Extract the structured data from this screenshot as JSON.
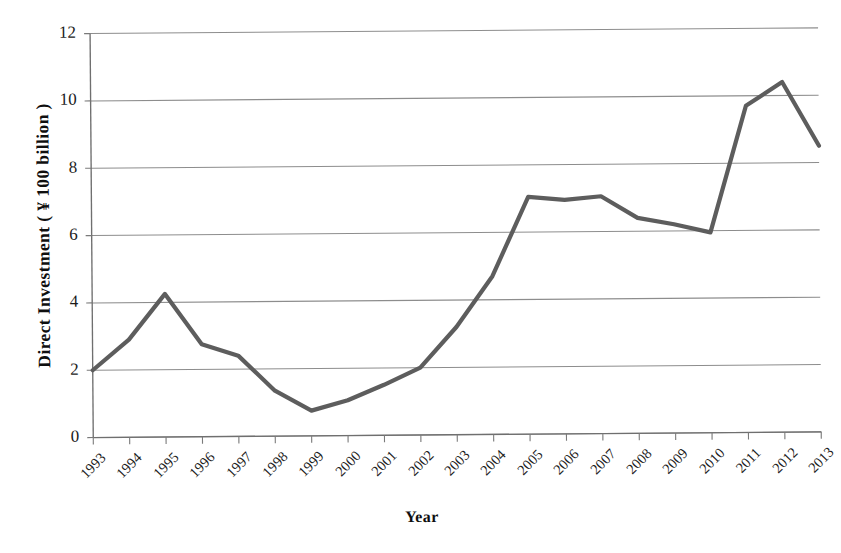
{
  "chart_data": {
    "type": "line",
    "title": "",
    "xlabel": "Year",
    "ylabel": "Direct Investment ( ¥ 100 billion )",
    "categories": [
      "1993",
      "1994",
      "1995",
      "1996",
      "1997",
      "1998",
      "1999",
      "2000",
      "2001",
      "2002",
      "2003",
      "2004",
      "2005",
      "2006",
      "2007",
      "2008",
      "2009",
      "2010",
      "2011",
      "2012",
      "2013"
    ],
    "values": [
      2.0,
      2.9,
      4.25,
      2.75,
      2.4,
      1.35,
      0.75,
      1.05,
      1.5,
      2.0,
      3.2,
      4.7,
      7.05,
      6.95,
      7.05,
      6.4,
      6.2,
      5.95,
      9.7,
      10.4,
      8.5
    ],
    "series": [
      {
        "name": "Direct Investment",
        "color": "#5d5d5d",
        "values": [
          2.0,
          2.9,
          4.25,
          2.75,
          2.4,
          1.35,
          0.75,
          1.05,
          1.5,
          2.0,
          3.2,
          4.7,
          7.05,
          6.95,
          7.05,
          6.4,
          6.2,
          5.95,
          9.7,
          10.4,
          8.5
        ]
      }
    ],
    "ylim": [
      0,
      12
    ],
    "yticks": [
      0,
      2,
      4,
      6,
      8,
      10,
      12
    ],
    "ytick_labels": [
      "0",
      "2",
      "4",
      "6",
      "8",
      "10",
      "12"
    ],
    "grid": "horizontal",
    "legend": "none",
    "markers": "none",
    "xtick_rotation": -45
  },
  "axes": {
    "y_title": "Direct Investment ( ¥ 100 billion )",
    "x_title": "Year"
  },
  "colors": {
    "line": "#5d5d5d",
    "grid": "#8d8d8d",
    "axis": "#6f6f6f",
    "text": "#1b1b1b",
    "background": "#ffffff"
  }
}
